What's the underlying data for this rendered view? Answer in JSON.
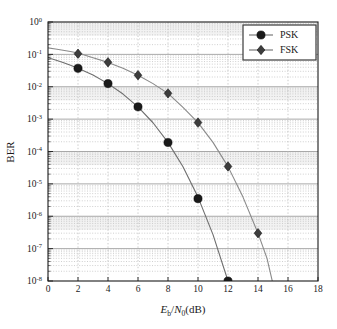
{
  "chart_data": {
    "type": "line",
    "title": "",
    "xlabel": "Eb/N0 (dB)",
    "xlabel_parts": {
      "e": "E",
      "sub_b": "b",
      "slash": "/",
      "n": "N",
      "sub_0": "0",
      "unit": "(dB)"
    },
    "ylabel": "BER",
    "xlim": [
      0,
      18
    ],
    "ylim": [
      1e-08,
      1
    ],
    "yscale": "log",
    "xticks": [
      0,
      2,
      4,
      6,
      8,
      10,
      12,
      14,
      16,
      18
    ],
    "xticklabels": [
      "0",
      "2",
      "4",
      "6",
      "8",
      "10",
      "12",
      "14",
      "16",
      "18"
    ],
    "yticks": [
      1,
      0.1,
      0.01,
      0.001,
      0.0001,
      1e-05,
      1e-06,
      1e-07,
      1e-08
    ],
    "yticklabels": [
      "10^0",
      "10^-1",
      "10^-2",
      "10^-3",
      "10^-4",
      "10^-5",
      "10^-6",
      "10^-7",
      "10^-8"
    ],
    "ytick_bases": [
      "10",
      "10",
      "10",
      "10",
      "10",
      "10",
      "10",
      "10",
      "10"
    ],
    "ytick_exponents": [
      "0",
      "-1",
      "-2",
      "-3",
      "-4",
      "-5",
      "-6",
      "-7",
      "-8"
    ],
    "grid": true,
    "grid_minor": true,
    "legend_position": "upper right",
    "series": [
      {
        "name": "PSK",
        "marker": "circle",
        "color": "#1a1a1a",
        "line_color": "#6e6e6e",
        "x": [
          2,
          4,
          6,
          8,
          10,
          12
        ],
        "y": [
          0.037,
          0.0125,
          0.0024,
          0.00019,
          3.5e-06,
          1e-08
        ],
        "curve_x": [
          0,
          0.5,
          1,
          1.5,
          2,
          3,
          4,
          5,
          6,
          7,
          8,
          9,
          10,
          11,
          12
        ],
        "curve_y": [
          0.0786,
          0.0671,
          0.0563,
          0.0464,
          0.0375,
          0.0229,
          0.0125,
          0.00595,
          0.0024,
          0.000773,
          0.000191,
          3.36e-05,
          3.9e-06,
          2.7e-07,
          1e-08
        ]
      },
      {
        "name": "FSK",
        "marker": "diamond",
        "color": "#3d3d3d",
        "line_color": "#8a8a8a",
        "x": [
          2,
          4,
          6,
          8,
          10,
          12,
          14
        ],
        "y": [
          0.105,
          0.057,
          0.0227,
          0.00625,
          0.00078,
          3.45e-05,
          3e-07
        ],
        "curve_x": [
          0,
          0.5,
          1,
          1.5,
          2,
          3,
          4,
          5,
          6,
          7,
          8,
          9,
          10,
          11,
          12,
          13,
          14,
          14.6,
          15
        ],
        "curve_y": [
          0.1587,
          0.1468,
          0.1347,
          0.1224,
          0.1103,
          0.0786,
          0.0565,
          0.0375,
          0.0227,
          0.0125,
          0.00625,
          0.0023,
          0.00078,
          0.000191,
          3.41e-05,
          3.9e-06,
          3e-07,
          5e-08,
          8e-09
        ]
      }
    ],
    "legend": [
      {
        "label": "PSK",
        "marker": "circle"
      },
      {
        "label": "FSK",
        "marker": "diamond"
      }
    ]
  },
  "colors": {
    "axis": "#1a1a1a",
    "grid_major": "#9a9a9a",
    "grid_minor": "#bcbcbc",
    "background": "#ffffff",
    "band": "#f2f2f2",
    "psk": "#1a1a1a",
    "fsk": "#3d3d3d"
  }
}
